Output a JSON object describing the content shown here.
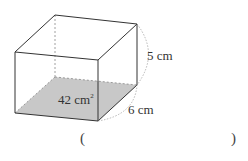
{
  "figure": {
    "shape": "rectangular prism",
    "base_area_label": "42 cm",
    "base_area_superscript": "2",
    "height_label": "5 cm",
    "depth_label": "6 cm",
    "base_fill_color": "#c8c8c8",
    "edge_color": "#333333",
    "hidden_edge_color": "#888888"
  },
  "answer": {
    "open_paren": "(",
    "close_paren": ")",
    "value": ""
  }
}
